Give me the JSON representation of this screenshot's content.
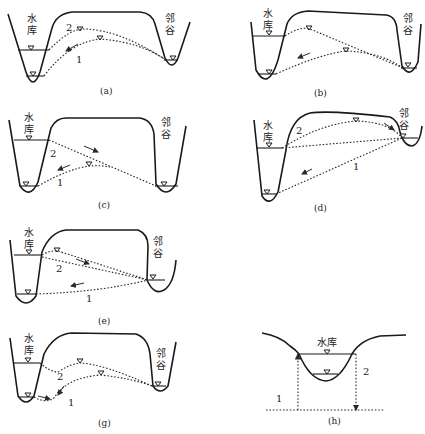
{
  "labels": {
    "reservoir_line1": "水",
    "reservoir_line2": "库",
    "reservoir_inline": "水库",
    "valley_line1": "邻",
    "valley_line2": "谷",
    "curve_1": "1",
    "curve_2": "2"
  },
  "panels": [
    {
      "id": "a",
      "caption": "(a)"
    },
    {
      "id": "b",
      "caption": "(b)"
    },
    {
      "id": "c",
      "caption": "(c)"
    },
    {
      "id": "d",
      "caption": "(d)"
    },
    {
      "id": "e",
      "caption": "(e)"
    },
    {
      "id": "f",
      "caption": "(f)"
    },
    {
      "id": "g",
      "caption": "(g)"
    },
    {
      "id": "h",
      "caption": "(h)"
    }
  ],
  "colors": {
    "line": "#1a1a1a",
    "background": "#ffffff"
  }
}
